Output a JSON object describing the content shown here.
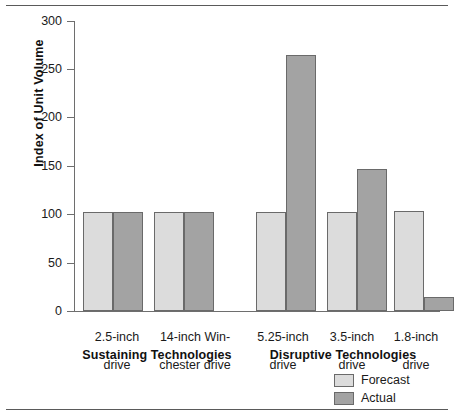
{
  "chart_data": {
    "type": "bar",
    "title": "",
    "xlabel": "",
    "ylabel": "Index of Unit Volume",
    "ylim": [
      0,
      300
    ],
    "yticks": [
      0,
      50,
      100,
      150,
      200,
      250,
      300
    ],
    "grid": false,
    "legend_position": "bottom-right",
    "categories": [
      "2.5-inch\ndrive",
      "14-inch Win-\nchester drive",
      "5.25-inch\ndrive",
      "3.5-inch\ndrive",
      "1.8-inch\ndrive"
    ],
    "series": [
      {
        "name": "Forecast",
        "color": "#dcdcdc",
        "values": [
          102,
          102,
          102,
          102,
          103
        ]
      },
      {
        "name": "Actual",
        "color": "#a3a3a3",
        "values": [
          102,
          102,
          265,
          147,
          15
        ]
      }
    ],
    "groups": [
      {
        "label": "Sustaining Technologies",
        "categories": [
          "2.5-inch drive",
          "14-inch Winchester drive"
        ]
      },
      {
        "label": "Disruptive Technologies",
        "categories": [
          "5.25-inch drive",
          "3.5-inch drive",
          "1.8-inch drive"
        ]
      }
    ],
    "annotations": []
  },
  "axis": {
    "y_label": "Index of Unit Volume",
    "tick_labels": [
      "300",
      "250",
      "200",
      "150",
      "100",
      "50",
      "0"
    ]
  },
  "categories": [
    {
      "line1": "2.5-inch",
      "line2": "drive"
    },
    {
      "line1": "14-inch Win-",
      "line2": "chester drive"
    },
    {
      "line1": "5.25-inch",
      "line2": "drive"
    },
    {
      "line1": "3.5-inch",
      "line2": "drive"
    },
    {
      "line1": "1.8-inch",
      "line2": "drive"
    }
  ],
  "groups": [
    {
      "label": "Sustaining Technologies"
    },
    {
      "label": "Disruptive Technologies"
    }
  ],
  "legend": {
    "items": [
      {
        "label": "Forecast",
        "color": "#dcdcdc"
      },
      {
        "label": "Actual",
        "color": "#a3a3a3"
      }
    ]
  }
}
